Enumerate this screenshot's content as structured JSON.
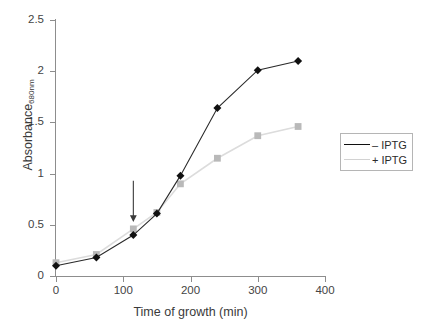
{
  "chart_data": {
    "type": "line",
    "title": "",
    "xlabel": "Time of growth (min)",
    "ylabel": "Absorbance",
    "ylabel_sub": "680nm",
    "xlim": [
      0,
      400
    ],
    "ylim": [
      0,
      2.5
    ],
    "xticks": [
      0,
      100,
      200,
      300,
      400
    ],
    "xtick_labels": [
      "0",
      "100",
      "200",
      "300",
      "400"
    ],
    "yticks": [
      0,
      0.5,
      1,
      1.5,
      2,
      2.5
    ],
    "ytick_labels": [
      "0",
      "0.5",
      "1",
      "1.5",
      "2",
      "2.5"
    ],
    "grid": false,
    "legend_position": "right",
    "x": [
      0,
      60,
      115,
      150,
      185,
      240,
      300,
      360
    ],
    "series": [
      {
        "name": "– IPTG",
        "marker": "diamond",
        "color": "#101010",
        "values": [
          0.1,
          0.18,
          0.4,
          0.61,
          0.98,
          1.64,
          2.01,
          2.1
        ]
      },
      {
        "name": "+ IPTG",
        "marker": "square",
        "color": "#b9b9b9",
        "values": [
          0.13,
          0.21,
          0.46,
          0.62,
          0.9,
          1.15,
          1.37,
          1.46
        ]
      }
    ],
    "annotations": [
      {
        "type": "arrow",
        "label": "",
        "x": 115,
        "y_tail": 0.93,
        "y_head": 0.55,
        "color": "#3a3a3a"
      }
    ]
  },
  "legend": {
    "items": [
      {
        "label": "– IPTG"
      },
      {
        "label": "+ IPTG"
      }
    ]
  }
}
